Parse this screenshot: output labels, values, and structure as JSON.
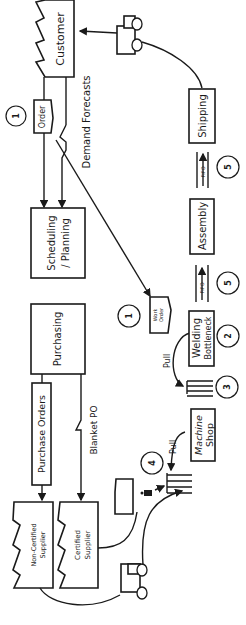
{
  "diagram": {
    "type": "value-stream-map",
    "orientation": "rotated-90-ccw",
    "entities": {
      "customer": "Customer",
      "order": "Order",
      "demand_forecasts": "Demand Forecasts",
      "scheduling": "Scheduling / Planning",
      "scheduling_line1": "Scheduling",
      "scheduling_line2": "/ Planning",
      "purchasing": "Purchasing",
      "purchase_orders": "Purchase Orders",
      "blanket_po": "Blanket PO",
      "non_certified_supplier_line1": "Non-Certified",
      "non_certified_supplier_line2": "Supplier",
      "certified_supplier_line1": "Certified",
      "certified_supplier_line2": "Supplier",
      "work_order_line1": "Work",
      "work_order_line2": "Order",
      "welding_line1": "Welding",
      "welding_line2": "Bottleneck",
      "machine_shop_line1": "Machine",
      "machine_shop_line2": "Shop",
      "assembly": "Assembly",
      "shipping": "Shipping",
      "pull_1": "Pull",
      "pull_2": "Pull",
      "fifo_1": "FIFO",
      "fifo_2": "FIFO"
    },
    "markers": [
      {
        "id": "m1a",
        "label": "1"
      },
      {
        "id": "m1b",
        "label": "1"
      },
      {
        "id": "m2",
        "label": "2"
      },
      {
        "id": "m3",
        "label": "3"
      },
      {
        "id": "m4",
        "label": "4"
      },
      {
        "id": "m5a",
        "label": "5"
      },
      {
        "id": "m5b",
        "label": "5"
      }
    ]
  }
}
